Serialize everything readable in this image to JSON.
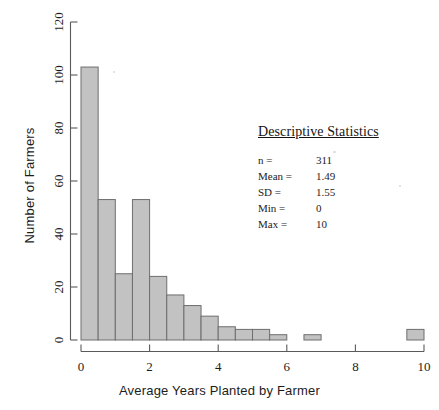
{
  "chart_data": {
    "type": "bar",
    "title": "",
    "subtitle": "",
    "xlabel": "Average Years Planted by Farmer",
    "ylabel": "Number of Farmers",
    "xlim": [
      -0.3,
      10.3
    ],
    "ylim": [
      0,
      120
    ],
    "xticks": [
      0,
      2,
      4,
      6,
      8,
      10
    ],
    "xtick_labels": [
      "0",
      "2",
      "4",
      "6",
      "8",
      "10"
    ],
    "yticks": [
      0,
      20,
      40,
      60,
      80,
      100,
      120
    ],
    "ytick_labels": [
      "0",
      "20",
      "40",
      "60",
      "80",
      "100",
      "120"
    ],
    "grid": false,
    "legend": null,
    "bin_width": 0.5,
    "bin_starts": [
      0,
      0.5,
      1,
      1.5,
      2,
      2.5,
      3,
      3.5,
      4,
      4.5,
      5,
      5.5,
      6,
      6.5,
      9.5
    ],
    "categories": [
      "0-0.5",
      "0.5-1",
      "1-1.5",
      "1.5-2",
      "2-2.5",
      "2.5-3",
      "3-3.5",
      "3.5-4",
      "4-4.5",
      "4.5-5",
      "5-5.5",
      "5.5-6",
      "6-6.5",
      "6.5-7",
      "9.5-10"
    ],
    "values": [
      103,
      53,
      25,
      53,
      24,
      17,
      13,
      9,
      5,
      4,
      4,
      2,
      0,
      2,
      4
    ],
    "bar_fill_color": "#c2c2c2",
    "bar_edge_color": "#6e6e6e",
    "axis_color": "#5a5a5a"
  },
  "annotations": {
    "stats_box": {
      "title": "Descriptive Statistics",
      "rows": [
        {
          "label": "n =",
          "value": "311"
        },
        {
          "label": "Mean =",
          "value": "1.49"
        },
        {
          "label": "SD =",
          "value": "1.55"
        },
        {
          "label": "Min =",
          "value": "0"
        },
        {
          "label": "Max =",
          "value": "10"
        }
      ]
    }
  }
}
